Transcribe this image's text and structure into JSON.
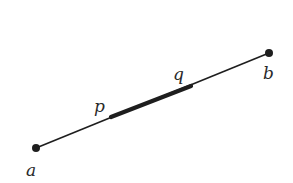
{
  "diagram": {
    "colors": {
      "line": "#1e1e1e",
      "background": "#ffffff"
    },
    "points": {
      "a": {
        "label": "a",
        "x": 36,
        "y": 148
      },
      "b": {
        "label": "b",
        "x": 269,
        "y": 53
      },
      "p": {
        "label": "p",
        "x": 111,
        "y": 117
      },
      "q": {
        "label": "q",
        "x": 191,
        "y": 86
      }
    },
    "labels": {
      "a": "a",
      "b": "b",
      "p": "p",
      "q": "q"
    }
  }
}
